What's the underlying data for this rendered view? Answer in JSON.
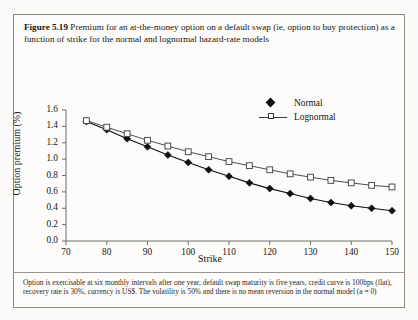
{
  "figure": {
    "label": "Figure 5.19",
    "caption": "Premium for an at-the-money option on a default swap (ie, option to buy protection) as a function of strike for the normal and lognormal hazard-rate models",
    "footnote": "Option is exercisable at six monthly intervals after one year, default swap maturity is five years, credit curve is 100bps (flat), recovery rate is 30%, currency is US$. The volatility is 50% and there is no mean reversion in the normal model (a = 0)"
  },
  "chart_data": {
    "type": "line",
    "title": "",
    "xlabel": "Strike",
    "ylabel": "Option premium (%)",
    "xlim": [
      70,
      150
    ],
    "ylim": [
      0.0,
      1.6
    ],
    "xticks": [
      70,
      80,
      90,
      100,
      110,
      120,
      130,
      140,
      150
    ],
    "yticks": [
      "0.0",
      "0.2",
      "0.4",
      "0.6",
      "0.8",
      "1.0",
      "1.2",
      "1.4",
      "1.6"
    ],
    "grid": false,
    "legend_position": "top-right",
    "x": [
      75,
      80,
      85,
      90,
      95,
      100,
      105,
      110,
      115,
      120,
      125,
      130,
      135,
      140,
      145,
      150
    ],
    "series": [
      {
        "name": "Normal",
        "marker": "filled-diamond",
        "color": "#101010",
        "values": [
          1.46,
          1.36,
          1.25,
          1.15,
          1.05,
          0.96,
          0.87,
          0.79,
          0.71,
          0.64,
          0.58,
          0.52,
          0.47,
          0.43,
          0.4,
          0.37
        ]
      },
      {
        "name": "Lognormal",
        "marker": "open-square",
        "color": "#3a3a3a",
        "values": [
          1.47,
          1.39,
          1.31,
          1.23,
          1.16,
          1.09,
          1.03,
          0.97,
          0.92,
          0.87,
          0.82,
          0.78,
          0.74,
          0.71,
          0.68,
          0.66
        ]
      }
    ]
  }
}
